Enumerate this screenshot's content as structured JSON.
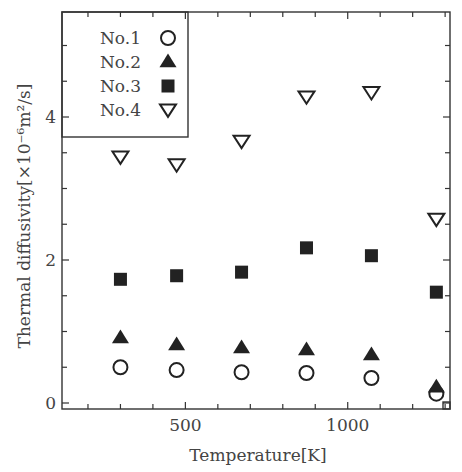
{
  "chart_data": {
    "type": "scatter",
    "title": "",
    "xlabel": "Temperature[K]",
    "ylabel": "Thermal diffusivity[×10⁻⁶m²/s]",
    "xlim": [
      120,
      1315
    ],
    "ylim": [
      -0.08,
      5.47
    ],
    "x_ticks": [
      500,
      1000
    ],
    "x_minor_step": 100,
    "y_ticks": [
      0,
      2,
      4
    ],
    "y_minor_step": 0.5,
    "grid": false,
    "legend_position": "upper left (boxed)",
    "x": [
      300,
      473,
      673,
      873,
      1073,
      1273
    ],
    "series": [
      {
        "name": "No.1",
        "marker": "open-circle",
        "values": [
          0.5,
          0.46,
          0.43,
          0.42,
          0.35,
          0.13
        ]
      },
      {
        "name": "No.2",
        "marker": "filled-triangle-up",
        "values": [
          0.91,
          0.81,
          0.77,
          0.74,
          0.67,
          0.22
        ]
      },
      {
        "name": "No.3",
        "marker": "filled-square",
        "values": [
          1.73,
          1.78,
          1.83,
          2.17,
          2.06,
          1.55
        ]
      },
      {
        "name": "No.4",
        "marker": "open-triangle-down",
        "values": [
          3.44,
          3.33,
          3.66,
          4.28,
          4.34,
          2.57
        ]
      }
    ]
  },
  "colors": {
    "axis": "#333333",
    "marker": "#222222",
    "text": "#444444"
  }
}
